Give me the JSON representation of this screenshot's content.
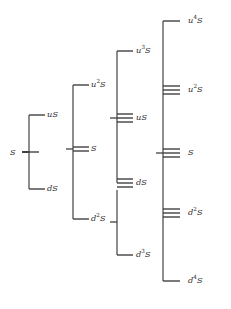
{
  "figure": {
    "type": "lattice-diagram",
    "width": 231,
    "height": 309,
    "background": "#ffffff",
    "line_color": "#3a3a3a",
    "text_color": "#2b2b2b"
  },
  "columns": [
    {
      "index": 0,
      "name": "column-0",
      "x_label": 13,
      "x_stub": 22,
      "x_spine": null,
      "nodes": [
        {
          "id": "c0-S",
          "label": "S",
          "base": "S",
          "sup": "",
          "y": 152,
          "multiplicity": 1,
          "label_x": 10,
          "label_y": 148
        }
      ]
    },
    {
      "index": 1,
      "name": "column-1",
      "x_spine": 29,
      "x_stub_left": 29,
      "x_stub_right": 45,
      "nodes": [
        {
          "id": "c1-uS",
          "label": "uS",
          "base": "u",
          "sup": "",
          "y": 115,
          "multiplicity": 1,
          "label_x": 47,
          "label_y": 110
        },
        {
          "id": "c1-dS",
          "label": "dS",
          "base": "d",
          "sup": "",
          "y": 189,
          "multiplicity": 1,
          "label_x": 47,
          "label_y": 184
        }
      ]
    },
    {
      "index": 2,
      "name": "column-2",
      "x_spine": 73,
      "x_stub_left": 73,
      "x_stub_right": 89,
      "nodes": [
        {
          "id": "c2-u2S",
          "label": "u2S",
          "base": "u",
          "sup": "2",
          "y": 85,
          "multiplicity": 1,
          "label_x": 91,
          "label_y": 80
        },
        {
          "id": "c2-S",
          "label": "S",
          "base": "S",
          "sup": "",
          "y": 149,
          "multiplicity": 2,
          "label_x": 91,
          "label_y": 144
        },
        {
          "id": "c2-d2S",
          "label": "d2S",
          "base": "d",
          "sup": "2",
          "y": 219,
          "multiplicity": 1,
          "label_x": 91,
          "label_y": 214
        }
      ]
    },
    {
      "index": 3,
      "name": "column-3",
      "x_spine": 117,
      "x_stub_left": 117,
      "x_stub_right": 133,
      "nodes": [
        {
          "id": "c3-u3S",
          "label": "u3S",
          "base": "u",
          "sup": "3",
          "y": 51,
          "multiplicity": 1,
          "label_x": 136,
          "label_y": 46
        },
        {
          "id": "c3-uS",
          "label": "uS",
          "base": "u",
          "sup": "",
          "y": 118,
          "multiplicity": 3,
          "label_x": 136,
          "label_y": 113
        },
        {
          "id": "c3-dS",
          "label": "dS",
          "base": "d",
          "sup": "",
          "y": 183,
          "multiplicity": 3,
          "label_x": 136,
          "label_y": 178
        },
        {
          "id": "c3-d3S",
          "label": "d3S",
          "base": "d",
          "sup": "3",
          "y": 255,
          "multiplicity": 1,
          "label_x": 136,
          "label_y": 250
        }
      ]
    },
    {
      "index": 4,
      "name": "column-4",
      "x_spine": 163,
      "x_stub_left": 163,
      "x_stub_right": 180,
      "nodes": [
        {
          "id": "c4-u4S",
          "label": "u4S",
          "base": "u",
          "sup": "4",
          "y": 21,
          "multiplicity": 1,
          "label_x": 188,
          "label_y": 16
        },
        {
          "id": "c4-u2S",
          "label": "u2S",
          "base": "u",
          "sup": "2",
          "y": 90,
          "multiplicity": 3,
          "label_x": 188,
          "label_y": 85
        },
        {
          "id": "c4-S",
          "label": "S",
          "base": "S",
          "sup": "",
          "y": 153,
          "multiplicity": 3,
          "label_x": 188,
          "label_y": 148
        },
        {
          "id": "c4-d2S",
          "label": "d2S",
          "base": "d",
          "sup": "2",
          "y": 213,
          "multiplicity": 3,
          "label_x": 188,
          "label_y": 208
        },
        {
          "id": "c4-d4S",
          "label": "d4S",
          "base": "d",
          "sup": "4",
          "y": 281,
          "multiplicity": 1,
          "label_x": 188,
          "label_y": 276
        }
      ]
    }
  ],
  "brackets": [
    {
      "id": "brk-0",
      "name": "bracket-column-1",
      "x": 29,
      "y_top": 115,
      "y_bottom": 189,
      "x_in": 22,
      "y_in": 152
    },
    {
      "id": "brk-1",
      "name": "bracket-column-2",
      "x": 73,
      "y_top": 85,
      "y_bottom": 219,
      "x_in": 66,
      "y_in": 149
    },
    {
      "id": "brk-2",
      "name": "bracket-column-3-upper",
      "x": 117,
      "y_top": 51,
      "y_bottom": 183,
      "x_in": 110,
      "y_in": 118
    },
    {
      "id": "brk-3",
      "name": "bracket-column-3-lower",
      "x": 117,
      "y_top": 190,
      "y_bottom": 255,
      "x_in": 110,
      "y_in": 222
    },
    {
      "id": "brk-4",
      "name": "bracket-column-4",
      "x": 163,
      "y_top": 21,
      "y_bottom": 281,
      "x_in": 156,
      "y_in": 153
    }
  ],
  "notes": {
    "multiplicity_line_gap": 4,
    "stub_length": 16,
    "level_line_length": 17
  }
}
